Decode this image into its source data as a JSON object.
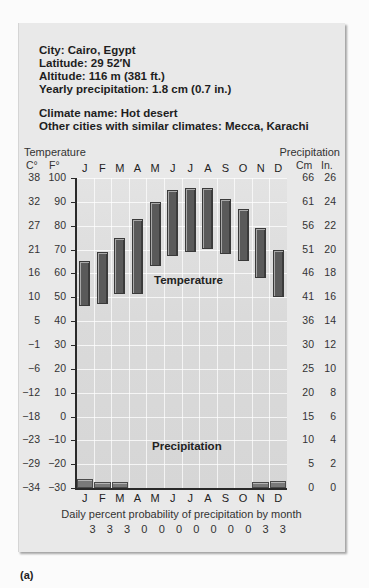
{
  "info": {
    "city": "City: Cairo, Egypt",
    "latitude": "Latitude: 29 52′N",
    "altitude": "Altitude: 116 m (381 ft.)",
    "yearly_precip": "Yearly precipitation: 1.8 cm (0.7 in.)",
    "climate_name": "Climate name: Hot desert",
    "similar": "Other cities with similar climates: Mecca, Karachi"
  },
  "axes": {
    "left_title": "Temperature",
    "right_title": "Precipitation",
    "left_unit_c": "C°",
    "left_unit_f": "F°",
    "right_unit_cm": "Cm",
    "right_unit_in": "In.",
    "celsius_ticks": [
      "38",
      "32",
      "27",
      "21",
      "16",
      "10",
      "5",
      "−1",
      "−6",
      "−12",
      "−18",
      "−23",
      "−29",
      "−34"
    ],
    "fahrenheit_ticks": [
      "100",
      "90",
      "80",
      "70",
      "60",
      "50",
      "40",
      "30",
      "20",
      "10",
      "0",
      "−10",
      "−20",
      "−30"
    ],
    "cm_ticks": [
      "66",
      "61",
      "56",
      "51",
      "46",
      "41",
      "36",
      "30",
      "25",
      "20",
      "15",
      "10",
      "5",
      "0"
    ],
    "in_ticks": [
      "26",
      "24",
      "22",
      "20",
      "18",
      "16",
      "14",
      "12",
      "10",
      "8",
      "6",
      "4",
      "2",
      "0"
    ]
  },
  "labels": {
    "temperature": "Temperature",
    "precipitation": "Precipitation",
    "prob_title": "Daily percent probability of precipitation by month",
    "figure": "(a)"
  },
  "months": [
    "J",
    "F",
    "M",
    "A",
    "M",
    "J",
    "J",
    "A",
    "S",
    "O",
    "N",
    "D"
  ],
  "probabilities": [
    "3",
    "3",
    "3",
    "0",
    "0",
    "0",
    "0",
    "0",
    "0",
    "0",
    "3",
    "3"
  ],
  "colors": {
    "card": "#e9e9e9",
    "plot": "#dadada",
    "bar": "#5a5a5a",
    "axis": "#2a2a2a"
  },
  "chart_data": {
    "type": "bar",
    "categories": [
      "J",
      "F",
      "M",
      "A",
      "M",
      "J",
      "J",
      "A",
      "S",
      "O",
      "N",
      "D"
    ],
    "xlabel": "Month",
    "ylabel": "Temperature (F° / C°)",
    "ylabel_right": "Precipitation (In. / Cm)",
    "ylim": [
      -30,
      100
    ],
    "ylim_right_cm": [
      0,
      66
    ],
    "series": [
      {
        "name": "Temperature high (°F)",
        "type": "floating-bar-top",
        "values": [
          65,
          69,
          75,
          83,
          90,
          95,
          96,
          96,
          91,
          87,
          79,
          70
        ]
      },
      {
        "name": "Temperature low (°F)",
        "type": "floating-bar-bottom",
        "values": [
          47,
          48,
          52,
          52,
          64,
          68,
          70,
          71,
          69,
          66,
          59,
          51
        ]
      },
      {
        "name": "Precipitation (cm)",
        "type": "bar",
        "values": [
          0.5,
          0.3,
          0.3,
          0,
          0,
          0,
          0,
          0,
          0,
          0,
          0.3,
          0.4
        ]
      },
      {
        "name": "Daily percent probability of precipitation",
        "type": "table",
        "values": [
          3,
          3,
          3,
          0,
          0,
          0,
          0,
          0,
          0,
          0,
          3,
          3
        ]
      }
    ],
    "annotations": [
      "Temperature",
      "Precipitation"
    ],
    "grid": true,
    "legend": "none"
  }
}
